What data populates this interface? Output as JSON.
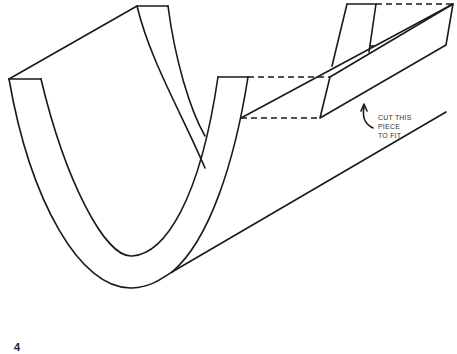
{
  "diagram": {
    "annotation": {
      "lines": [
        "CUT THIS",
        "PIECE",
        "TO FIT"
      ]
    },
    "page_number": "4"
  }
}
